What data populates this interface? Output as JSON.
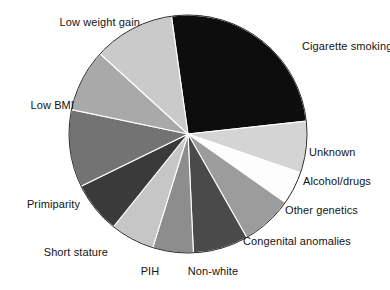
{
  "figure": {
    "kind": "pie-chart-figure",
    "background": "#ffffff",
    "label_color": "#131313"
  },
  "chart_data": {
    "type": "pie",
    "title": "",
    "subtitle": "",
    "xlabel": "",
    "ylabel": "",
    "legend_position": "none",
    "grid": false,
    "note": "Attributable risk factors for low birth weight / fetal growth restriction, shown as proportions of a whole.",
    "start_angle_deg": -8,
    "direction": "clockwise",
    "total": 100,
    "labels": [
      "Cigarette smoking",
      "Unknown",
      "Alcohol/drugs",
      "Other genetics",
      "Congenital anomalies",
      "Non-white",
      "PIH",
      "Short stature",
      "Primiparity",
      "Low BMI",
      "Low weight gain"
    ],
    "values": [
      25.5,
      7.0,
      4.5,
      7.0,
      7.5,
      5.5,
      6.0,
      7.0,
      10.5,
      8.5,
      11.0
    ],
    "colors": [
      "#0d0d0d",
      "#d4d4d4",
      "#fdfdfd",
      "#9c9c9c",
      "#4a4a4a",
      "#8d8d8d",
      "#c6c6c6",
      "#3a3a3a",
      "#737373",
      "#a9a9a9",
      "#cacaca"
    ],
    "slices": [
      {
        "label": "Cigarette smoking",
        "value": 25.5,
        "color": "#0d0d0d"
      },
      {
        "label": "Unknown",
        "value": 7.0,
        "color": "#d4d4d4"
      },
      {
        "label": "Alcohol/drugs",
        "value": 4.5,
        "color": "#fdfdfd"
      },
      {
        "label": "Other genetics",
        "value": 7.0,
        "color": "#9c9c9c"
      },
      {
        "label": "Congenital anomalies",
        "value": 7.5,
        "color": "#4a4a4a"
      },
      {
        "label": "Non-white",
        "value": 5.5,
        "color": "#8d8d8d"
      },
      {
        "label": "PIH",
        "value": 6.0,
        "color": "#c6c6c6"
      },
      {
        "label": "Short stature",
        "value": 7.0,
        "color": "#3a3a3a"
      },
      {
        "label": "Primiparity",
        "value": 10.5,
        "color": "#737373"
      },
      {
        "label": "Low BMI",
        "value": 8.5,
        "color": "#a9a9a9"
      },
      {
        "label": "Low weight gain",
        "value": 11.0,
        "color": "#cacaca"
      }
    ]
  },
  "labels": {
    "cigarette_smoking": "Cigarette smoking",
    "unknown": "Unknown",
    "alcohol_drugs": "Alcohol/drugs",
    "other_genetics": "Other genetics",
    "congenital_anomalies": "Congenital anomalies",
    "non_white": "Non-white",
    "pih": "PIH",
    "short_stature": "Short stature",
    "primiparity": "Primiparity",
    "low_bmi": "Low BMI",
    "low_weight_gain": "Low weight gain"
  }
}
